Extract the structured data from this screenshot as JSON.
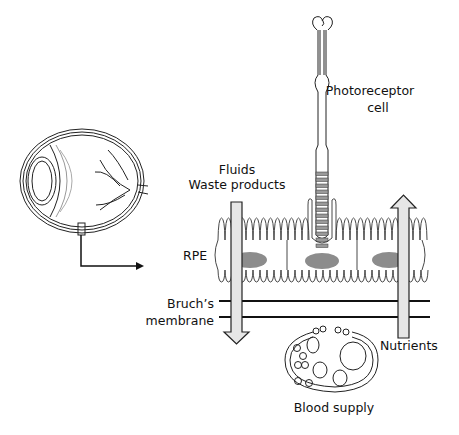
{
  "labels": {
    "photoreceptor_line1": "Photoreceptor",
    "photoreceptor_line2": "cell",
    "fluids": "Fluids",
    "waste": "Waste products",
    "rpe": "RPE",
    "bruch_line1": "Bruch’s",
    "bruch_line2": "membrane",
    "nutrients": "Nutrients",
    "blood": "Blood supply"
  },
  "colors": {
    "line": "#222222",
    "nucleus": "#8c8c8c",
    "arrow_fill": "#e6e6e6",
    "disc": "#9a9a9a"
  }
}
